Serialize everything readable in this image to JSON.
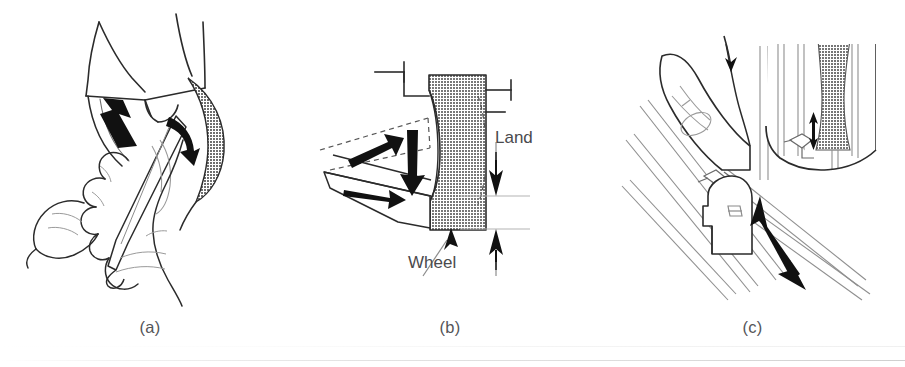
{
  "figure": {
    "type": "technical-illustration",
    "panel_count": 3,
    "background_color": "#ffffff",
    "line_color": "#2b2b2b",
    "shade_gray": "#8e8e8e",
    "text_color": "#4a4a4d"
  },
  "panels": [
    {
      "id": "a",
      "caption": "(a)",
      "subject": "hand holding a sharpening tool against a curved blade, with two curved motion arrows",
      "icons": [
        "hand-icon",
        "blade-arc-icon",
        "curved-arrow-up-icon",
        "curved-arrow-down-icon"
      ],
      "labels": []
    },
    {
      "id": "b",
      "caption": "(b)",
      "subject": "cross-section of grinding wheel contacting a tool edge showing feed directions and the land dimension",
      "icons": [
        "grinding-wheel-icon",
        "feed-arrow-icon",
        "plunge-arrow-icon",
        "dimension-arrow-icon"
      ],
      "labels": [
        {
          "name": "land",
          "text": "Land"
        },
        {
          "name": "wheel",
          "text": "Wheel"
        }
      ]
    },
    {
      "id": "c",
      "caption": "(c)",
      "subject": "tool holder riding along a guide with a double-headed traverse arrow and a magnified inset of the wheel profile",
      "icons": [
        "tool-holder-icon",
        "double-arrow-icon",
        "inset-detail-icon",
        "small-up-down-arrow-icon"
      ],
      "labels": []
    }
  ],
  "callouts": {
    "land_label": "Land",
    "wheel_label": "Wheel"
  },
  "captions": {
    "a": "(a)",
    "b": "(b)",
    "c": "(c)"
  }
}
